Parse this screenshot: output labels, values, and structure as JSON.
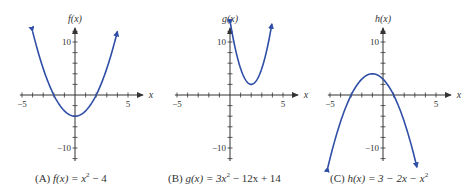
{
  "colors": {
    "curve": "#2f4ea6",
    "axis": "#333333",
    "text": "#333333",
    "background": "#ffffff"
  },
  "chart_data": [
    {
      "type": "line",
      "panel": "A",
      "title": "(A) f(x) = x^2 - 4",
      "caption_label": "(A)",
      "caption_fn": "f(x) = x",
      "caption_exp": "2",
      "caption_rest": " − 4",
      "ylabel": "f(x)",
      "xlabel": "x",
      "xlim": [
        -6,
        6.5
      ],
      "ylim": [
        -12,
        13
      ],
      "xticks_labeled": [
        -5,
        5
      ],
      "yticks_labeled": [
        10,
        -10
      ],
      "tick_step_x": 1,
      "tick_step_y": 2,
      "grid": false,
      "domain": [
        -4,
        4
      ],
      "coefficients": {
        "a": 1,
        "b": 0,
        "c": -4
      },
      "endpoints": "arrows",
      "x": [
        -4,
        -3,
        -2,
        -1,
        0,
        1,
        2,
        3,
        4
      ],
      "y": [
        12,
        5,
        0,
        -3,
        -4,
        -3,
        0,
        5,
        12
      ]
    },
    {
      "type": "line",
      "panel": "B",
      "title": "(B) g(x) = 3x^2 - 12x + 14",
      "caption_label": "(B)",
      "caption_fn": "g(x) = 3x",
      "caption_exp": "2",
      "caption_rest": " − 12x + 14",
      "ylabel": "g(x)",
      "xlabel": "x",
      "xlim": [
        -6,
        6.5
      ],
      "ylim": [
        -12,
        13
      ],
      "xticks_labeled": [
        -5,
        5
      ],
      "yticks_labeled": [
        10,
        -10
      ],
      "tick_step_x": 1,
      "tick_step_y": 2,
      "grid": false,
      "domain": [
        0.05,
        3.95
      ],
      "coefficients": {
        "a": 3,
        "b": -12,
        "c": 14
      },
      "endpoints": "arrows",
      "x": [
        0,
        1,
        2,
        3,
        4
      ],
      "y": [
        14,
        5,
        2,
        5,
        14
      ]
    },
    {
      "type": "line",
      "panel": "C",
      "title": "(C) h(x) = 3 - 2x - x^2",
      "caption_label": "(C)",
      "caption_fn": "h(x) = 3 − 2x − x",
      "caption_exp": "2",
      "caption_rest": "",
      "ylabel": "h(x)",
      "xlabel": "x",
      "xlim": [
        -6,
        6.5
      ],
      "ylim": [
        -14,
        13
      ],
      "xticks_labeled": [
        -5,
        5
      ],
      "yticks_labeled": [
        10,
        -10
      ],
      "tick_step_x": 1,
      "tick_step_y": 2,
      "grid": false,
      "domain": [
        -5.2,
        3.2
      ],
      "coefficients": {
        "a": -1,
        "b": -2,
        "c": 3
      },
      "endpoints": "arrows",
      "x": [
        -5,
        -4,
        -3,
        -2,
        -1,
        0,
        1,
        2,
        3
      ],
      "y": [
        -12,
        -5,
        0,
        3,
        4,
        3,
        0,
        -5,
        -12
      ]
    }
  ],
  "panels": [
    {
      "origin": [
        75,
        95
      ],
      "caption_x": 35
    },
    {
      "origin": [
        230,
        95
      ],
      "caption_x": 168
    },
    {
      "origin": [
        383,
        95
      ],
      "caption_x": 330
    }
  ],
  "scale": {
    "px_per_x": 10.6,
    "px_per_y": 5.3
  },
  "axis_labels": {
    "x": "x",
    "tick_neg5": "−5",
    "tick_pos5": "5",
    "tick_pos10": "10",
    "tick_neg10": "−10"
  }
}
